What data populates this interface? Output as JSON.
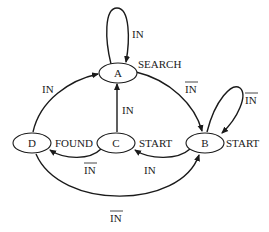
{
  "nodes": {
    "A": {
      "id": "A",
      "output": "SEARCH"
    },
    "B": {
      "id": "B",
      "output": "START"
    },
    "C": {
      "id": "C",
      "output": "START"
    },
    "D": {
      "id": "D",
      "output": "FOUND"
    }
  },
  "edges": {
    "a_self": {
      "from": "A",
      "to": "A",
      "label": "IN"
    },
    "a_to_b": {
      "from": "A",
      "to": "B",
      "label": "IN",
      "negated": true
    },
    "b_self": {
      "from": "B",
      "to": "B",
      "label": "IN",
      "negated": true
    },
    "b_to_c": {
      "from": "B",
      "to": "C",
      "label": "IN"
    },
    "c_to_a": {
      "from": "C",
      "to": "A",
      "label": "IN"
    },
    "c_to_d": {
      "from": "C",
      "to": "D",
      "label": "IN",
      "negated": true
    },
    "d_to_a": {
      "from": "D",
      "to": "A",
      "label": "IN"
    },
    "d_to_b": {
      "from": "D",
      "to": "B",
      "label": "IN",
      "negated": true
    }
  },
  "colors": {
    "stroke": "#1a1a1a",
    "background": "#ffffff"
  }
}
